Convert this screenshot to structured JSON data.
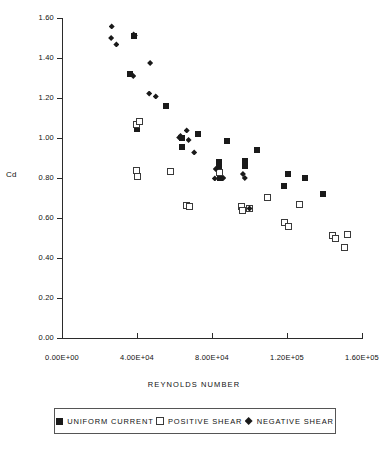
{
  "chart_data": {
    "type": "scatter",
    "title": "",
    "xlabel": "REYNOLDS NUMBER",
    "ylabel": "Cd",
    "xlim": [
      0,
      160000
    ],
    "ylim": [
      0,
      1.6
    ],
    "grid": false,
    "legend_position": "bottom",
    "x_tick_labels": [
      "0.00E+00",
      "4.00E+04",
      "8.00E+04",
      "1.20E+05",
      "1.60E+05"
    ],
    "x_tick_values": [
      0,
      40000,
      80000,
      120000,
      160000
    ],
    "y_tick_labels": [
      "0.00",
      "0.20",
      "0.40",
      "0.60",
      "0.80",
      "1.00",
      "1.20",
      "1.40",
      "1.60"
    ],
    "y_tick_values": [
      0.0,
      0.2,
      0.4,
      0.6,
      0.8,
      1.0,
      1.2,
      1.4,
      1.6
    ],
    "series": [
      {
        "name": "UNIFORM CURRENT",
        "marker": "filled-square",
        "color": "#1a1a1a",
        "points": [
          [
            36500,
            1.32
          ],
          [
            38500,
            1.51
          ],
          [
            39800,
            1.043
          ],
          [
            40200,
            1.07
          ],
          [
            55500,
            1.16
          ],
          [
            63800,
            1.0
          ],
          [
            64200,
            0.955
          ],
          [
            72500,
            1.02
          ],
          [
            83500,
            0.88
          ],
          [
            83800,
            0.855
          ],
          [
            84500,
            0.8
          ],
          [
            88000,
            0.985
          ],
          [
            97500,
            0.862
          ],
          [
            97800,
            0.885
          ],
          [
            104000,
            0.94
          ],
          [
            118500,
            0.762
          ],
          [
            120500,
            0.822
          ],
          [
            129500,
            0.8
          ],
          [
            139000,
            0.722
          ]
        ]
      },
      {
        "name": "POSITIVE SHEAR",
        "marker": "open-square",
        "color": "#ffffff",
        "points": [
          [
            39500,
            1.068
          ],
          [
            41200,
            1.085
          ],
          [
            39800,
            0.838
          ],
          [
            40200,
            0.808
          ],
          [
            58000,
            0.832
          ],
          [
            66500,
            0.662
          ],
          [
            67800,
            0.66
          ],
          [
            83800,
            0.828
          ],
          [
            95500,
            0.658
          ],
          [
            96500,
            0.64
          ],
          [
            99800,
            0.65
          ],
          [
            109500,
            0.705
          ],
          [
            118500,
            0.578
          ],
          [
            120800,
            0.56
          ],
          [
            126500,
            0.668
          ],
          [
            144500,
            0.512
          ],
          [
            145800,
            0.498
          ],
          [
            152500,
            0.518
          ],
          [
            150500,
            0.455
          ]
        ]
      },
      {
        "name": "NEGATIVE SHEAR",
        "marker": "diamond",
        "color": "#1a1a1a",
        "points": [
          [
            26500,
            1.558
          ],
          [
            26200,
            1.5
          ],
          [
            29000,
            1.468
          ],
          [
            38800,
            1.512
          ],
          [
            38200,
            1.518
          ],
          [
            38000,
            1.31
          ],
          [
            47000,
            1.375
          ],
          [
            46500,
            1.222
          ],
          [
            50000,
            1.208
          ],
          [
            62500,
            1.003
          ],
          [
            63200,
            1.01
          ],
          [
            66500,
            1.038
          ],
          [
            67500,
            0.99
          ],
          [
            70500,
            0.928
          ],
          [
            82000,
            0.845
          ],
          [
            81500,
            0.798
          ],
          [
            86000,
            0.8
          ],
          [
            96500,
            0.82
          ],
          [
            97500,
            0.8
          ],
          [
            100000,
            0.648
          ]
        ]
      }
    ]
  },
  "axes": {
    "y_title": "Cd",
    "x_title": "REYNOLDS NUMBER"
  },
  "legend": {
    "entries": [
      {
        "label": "UNIFORM CURRENT",
        "marker": "filled-square"
      },
      {
        "label": "POSITIVE SHEAR",
        "marker": "open-square"
      },
      {
        "label": "NEGATIVE SHEAR",
        "marker": "diamond"
      }
    ]
  }
}
